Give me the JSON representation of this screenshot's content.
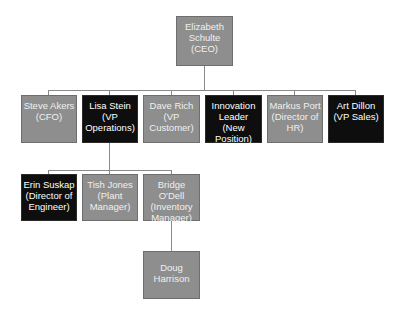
{
  "chart_title": "",
  "colors": {
    "gray_box": "#8e8e8e",
    "black_box": "#0e0e0e",
    "connector": "#8a8a8a",
    "text": "#f0f0f0"
  },
  "nodes": {
    "ceo": {
      "label": "Elizabeth\nSchulte\n(CEO)",
      "style": "gray"
    },
    "cfo": {
      "label": "Steve Akers\n(CFO)",
      "style": "gray"
    },
    "vp_ops": {
      "label": "Lisa Stein\n(VP\nOperations)",
      "style": "black"
    },
    "vp_customer": {
      "label": "Dave Rich\n(VP\nCustomer)",
      "style": "gray"
    },
    "innovation": {
      "label": "Innovation\nLeader (New\nPosition)",
      "style": "black"
    },
    "hr": {
      "label": "Markus Port\n(Director of\nHR)",
      "style": "gray"
    },
    "vp_sales": {
      "label": "Art Dillon\n(VP Sales)",
      "style": "black"
    },
    "dir_eng": {
      "label": "Erin Suskap\n(Director of\nEngineer)",
      "style": "black"
    },
    "plant_mgr": {
      "label": "Tish Jones\n(Plant\nManager)",
      "style": "gray"
    },
    "inv_mgr": {
      "label": "Bridge O'Dell\n(Inventory\nManager)",
      "style": "gray"
    },
    "doug": {
      "label": "Doug\nHarrison",
      "style": "gray"
    }
  },
  "hierarchy": {
    "ceo": [
      "cfo",
      "vp_ops",
      "vp_customer",
      "innovation",
      "hr",
      "vp_sales"
    ],
    "vp_ops": [
      "dir_eng",
      "plant_mgr",
      "inv_mgr"
    ],
    "inv_mgr": [
      "doug"
    ]
  }
}
